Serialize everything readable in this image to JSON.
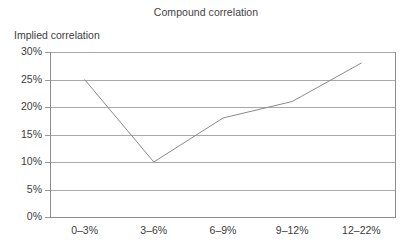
{
  "chart_data": {
    "type": "line",
    "title": "Compound correlation",
    "xlabel": "",
    "ylabel": "Implied correlation",
    "categories": [
      "0–3%",
      "3–6%",
      "6–9%",
      "9–12%",
      "12–22%"
    ],
    "values": [
      25,
      10,
      18,
      21,
      28
    ],
    "series": [
      {
        "name": "Implied correlation",
        "values": [
          25,
          10,
          18,
          21,
          28
        ]
      }
    ],
    "ylim": [
      0,
      30
    ],
    "ytick_labels": [
      "0%",
      "5%",
      "10%",
      "15%",
      "20%",
      "25%",
      "30%"
    ],
    "ytick_values": [
      0,
      5,
      10,
      15,
      20,
      25,
      30
    ],
    "grid": true,
    "grid_orientation": "horizontal",
    "legend": false,
    "legend_position": "none",
    "markers": false,
    "line_color": "#8a8a8a",
    "grid_color": "#a9a9a9",
    "axis_color": "#8d8d8d",
    "text_color": "#3c3c3c",
    "background_color": "#ffffff"
  }
}
